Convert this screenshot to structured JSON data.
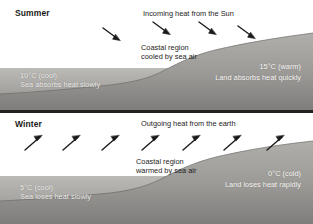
{
  "figure": {
    "width": 313,
    "height": 224,
    "colors": {
      "page_background": "#ffffff",
      "divider": "#23211f",
      "sky": "#ffffff",
      "sea_light": "#b9b7b4",
      "sea_dark": "#8e8c8a",
      "land_light": "#a8a6a3",
      "land_dark": "#7e7c7a",
      "arrow": "#1a1917",
      "text_dark": "#1e1d1b",
      "text_light": "#f4f3f0"
    }
  },
  "panels": [
    {
      "id": "summer",
      "season_label": "Summer",
      "heat_flow_label": "Incoming heat from the Sun",
      "coastal_note_line1": "Coastal region",
      "coastal_note_line2": "cooled by sea air",
      "sea_label_line1": "10°C (cool)",
      "sea_label_line2": "Sea absorbs heat slowly",
      "land_label_line1": "15°C (warm)",
      "land_label_line2": "Land absorbs heat quickly",
      "arrow_direction": "down-right",
      "arrow_count": 4,
      "sea_temperature_c": 10,
      "land_temperature_c": 15
    },
    {
      "id": "winter",
      "season_label": "Winter",
      "heat_flow_label": "Outgoing heat from the earth",
      "coastal_note_line1": "Coastal region",
      "coastal_note_line2": "warmed by sea air",
      "sea_label_line1": "5°C (cool)",
      "sea_label_line2": "Sea loses heat slowly",
      "land_label_line1": "0°C (cold)",
      "land_label_line2": "Land loses heat rapidly",
      "arrow_direction": "up-right",
      "arrow_count": 7,
      "sea_temperature_c": 5,
      "land_temperature_c": 0
    }
  ],
  "icons": {
    "arrow_down_right": "down-right-arrow-icon",
    "arrow_up_right": "up-right-arrow-icon"
  }
}
